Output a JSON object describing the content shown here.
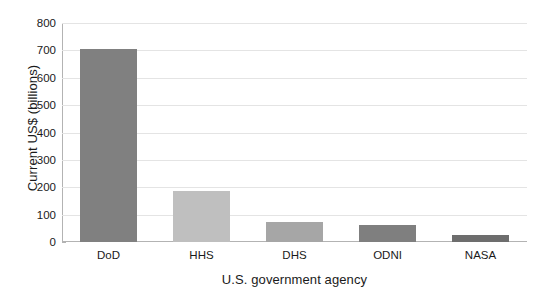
{
  "chart_data": {
    "type": "bar",
    "title": "",
    "xlabel": "U.S. government agency",
    "ylabel": "Current US$ (billions)",
    "categories": [
      "DoD",
      "HHS",
      "DHS",
      "ODNI",
      "NASA"
    ],
    "values": [
      705,
      188,
      73,
      63,
      25
    ],
    "series": [
      {
        "name": "Budget",
        "values": [
          705,
          188,
          73,
          63,
          25
        ]
      }
    ],
    "bar_colors": [
      "#808080",
      "#bfbfbf",
      "#a6a6a6",
      "#7f7f7f",
      "#6d6d6d"
    ],
    "ylim": [
      0,
      800
    ],
    "ytick_labels": [
      "0",
      "100",
      "200",
      "300",
      "400",
      "500",
      "600",
      "700",
      "800"
    ],
    "ytick_values": [
      0,
      100,
      200,
      300,
      400,
      500,
      600,
      700,
      800
    ],
    "grid": true,
    "grid_color": "#e4e4e4",
    "legend": "none",
    "axis_color": "#b3b3b3",
    "text_color": "#1a1a1a",
    "background": "#ffffff"
  }
}
